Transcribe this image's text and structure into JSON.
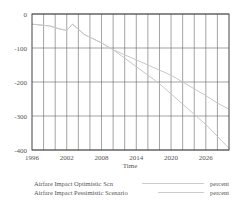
{
  "chart_data": {
    "type": "line",
    "title": "",
    "xlabel": "Time",
    "ylabel": "",
    "xlim": [
      1996,
      2030
    ],
    "ylim": [
      -400,
      0
    ],
    "grid": true,
    "x_ticks": [
      "1996",
      "2002",
      "2008",
      "2014",
      "2020",
      "2026"
    ],
    "y_ticks": [
      "0",
      "-100",
      "-200",
      "-300",
      "-400"
    ],
    "x": [
      1996,
      1999,
      2001,
      2002,
      2003,
      2005,
      2008,
      2010,
      2012,
      2014,
      2016,
      2018,
      2020,
      2022,
      2024,
      2026,
      2028,
      2030
    ],
    "series": [
      {
        "name": "Airfare Impact Optimistic Scn",
        "unit": "percent",
        "color": "#c8c8c8",
        "values": [
          -30,
          -35,
          -45,
          -48,
          -30,
          -60,
          -85,
          -105,
          -120,
          -135,
          -150,
          -165,
          -180,
          -200,
          -220,
          -240,
          -262,
          -280
        ]
      },
      {
        "name": "Airfare Impact Pessimistic Scenario",
        "unit": "percent",
        "color": "#c8c8c8",
        "values": [
          -30,
          -35,
          -45,
          -48,
          -30,
          -60,
          -85,
          -105,
          -130,
          -155,
          -180,
          -205,
          -235,
          -265,
          -295,
          -325,
          -360,
          -395
        ]
      }
    ],
    "legend_position": "bottom"
  },
  "legend": {
    "items": [
      {
        "label": "Airfare Impact Optimistic Scn",
        "unit": "percent"
      },
      {
        "label": "Airfare Impact Pessimistic Scenario",
        "unit": "percent"
      }
    ]
  },
  "axis": {
    "xlabel": "Time"
  }
}
